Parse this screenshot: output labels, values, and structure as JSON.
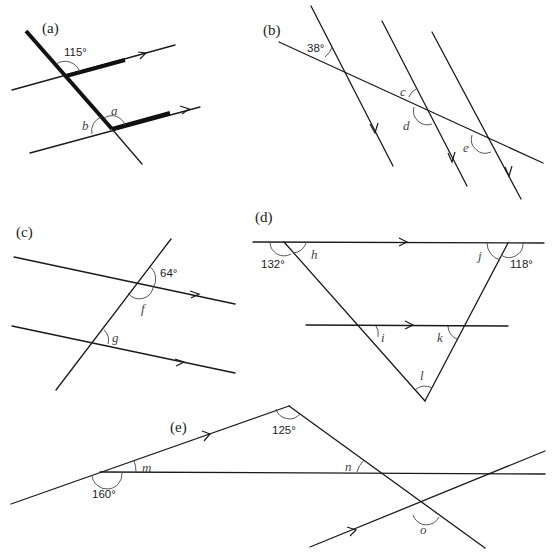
{
  "diagrams": {
    "a": {
      "label": "(a)",
      "given": "115°",
      "unknowns": [
        "a",
        "b"
      ]
    },
    "b": {
      "label": "(b)",
      "given": "38°",
      "unknowns": [
        "c",
        "d",
        "e"
      ]
    },
    "c": {
      "label": "(c)",
      "given": "64°",
      "unknowns": [
        "f",
        "g"
      ]
    },
    "d": {
      "label": "(d)",
      "given": [
        "132°",
        "118°"
      ],
      "unknowns": [
        "h",
        "i",
        "j",
        "k",
        "l"
      ]
    },
    "e": {
      "label": "(e)",
      "given": [
        "125°",
        "160°"
      ],
      "unknowns": [
        "m",
        "n",
        "o"
      ]
    }
  }
}
